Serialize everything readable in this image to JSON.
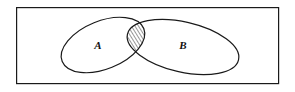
{
  "figure": {
    "name": "venn-diagram-two-sets-intersection",
    "type": "venn-diagram",
    "width": 295,
    "height": 92,
    "background_color": "#ffffff",
    "line_color": "#1a1a1a",
    "universe": {
      "shape": "rectangle",
      "label": "",
      "x": 16,
      "y": 7,
      "width": 263,
      "height": 77,
      "stroke_width": 1.2,
      "fill": "#ffffff"
    },
    "sets": [
      {
        "id": "set-a",
        "label": "A",
        "shape": "ellipse",
        "cx": 103,
        "cy": 45,
        "rx": 44,
        "ry": 24,
        "rotation_deg": -22,
        "fill": "none",
        "stroke_width": 1.2,
        "label_x": 98,
        "label_y": 49
      },
      {
        "id": "set-b",
        "label": "B",
        "shape": "ellipse",
        "cx": 183,
        "cy": 47,
        "rx": 57,
        "ry": 25,
        "rotation_deg": 13,
        "fill": "none",
        "stroke_width": 1.2,
        "label_x": 183,
        "label_y": 49
      }
    ],
    "intersection": {
      "id": "intersection-a-b",
      "label": "",
      "description": "hatched lens region",
      "hatch_pattern": "diagonal-lines",
      "hatch_angle_deg": 45,
      "hatch_spacing": 3,
      "hatch_stroke_width": 0.9,
      "fill": "#ffffff",
      "upper_crossing": [
        137,
        31
      ],
      "lower_crossing": [
        124,
        62
      ]
    }
  }
}
